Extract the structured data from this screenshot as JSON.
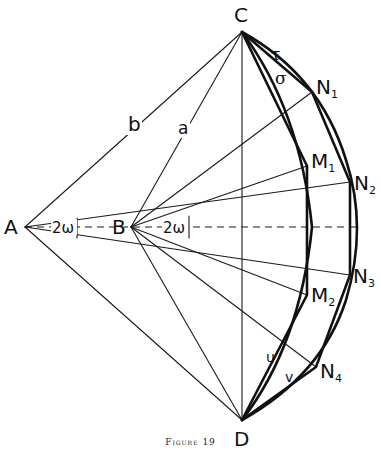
{
  "figure": {
    "caption": "Figure 19",
    "points": {
      "A": {
        "label": "A",
        "x": 25,
        "y": 227
      },
      "B": {
        "label": "B",
        "x": 131,
        "y": 227
      },
      "C": {
        "label": "C",
        "x": 242,
        "y": 32
      },
      "D": {
        "label": "D",
        "x": 242,
        "y": 420
      },
      "N1": {
        "label": "N",
        "sub": "1",
        "x": 312,
        "y": 92
      },
      "M1": {
        "label": "M",
        "sub": "1",
        "x": 307,
        "y": 166
      },
      "N2": {
        "label": "N",
        "sub": "2",
        "x": 350,
        "y": 182
      },
      "N3": {
        "label": "N",
        "sub": "3",
        "x": 350,
        "y": 275
      },
      "M2": {
        "label": "M",
        "sub": "2",
        "x": 307,
        "y": 295
      },
      "N4": {
        "label": "N",
        "sub": "4",
        "x": 316,
        "y": 367
      }
    },
    "segment_labels": {
      "b": "b",
      "a": "a",
      "tau": "τ",
      "sigma": "σ",
      "u": "u",
      "v": "v"
    },
    "angle_labels": {
      "at_A": "2ω",
      "at_B": "2ω"
    }
  }
}
